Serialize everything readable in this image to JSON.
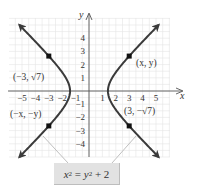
{
  "chart_data": {
    "type": "line",
    "title": "",
    "equation": "x^2 = y^2 + 2",
    "equation_display": {
      "lhs_var": "x",
      "lhs_exp": "2",
      "eq": " = ",
      "rhs_var": "y",
      "rhs_exp": "2",
      "rhs_tail": " + 2"
    },
    "xlabel": "x",
    "ylabel": "y",
    "xlim": [
      -5.5,
      6
    ],
    "ylim": [
      -5,
      5.5
    ],
    "grid": true,
    "x_ticks": [
      -5,
      -4,
      -3,
      -2,
      -1,
      1,
      2,
      3,
      4,
      5
    ],
    "y_ticks": [
      4,
      3,
      2,
      1,
      -1,
      -2,
      -3,
      -4
    ],
    "x_tick_labels": [
      "−5",
      "−4",
      "−3",
      "−2",
      "−1",
      "1",
      "2",
      "3",
      "4",
      "5"
    ],
    "y_tick_labels": [
      "4",
      "3",
      "2",
      "1",
      "−1",
      "−2",
      "−3",
      "−4"
    ],
    "series": [
      {
        "name": "right branch",
        "x_fn": "sqrt(y^2+2)",
        "y_range": [
          -5,
          5
        ],
        "vertex": [
          1.414,
          0
        ]
      },
      {
        "name": "left branch",
        "x_fn": "-sqrt(y^2+2)",
        "y_range": [
          -5,
          5
        ],
        "vertex": [
          -1.414,
          0
        ]
      }
    ],
    "points": [
      {
        "x": 3,
        "y": 2.646,
        "label": "(x, y)"
      },
      {
        "x": -3,
        "y": 2.646,
        "label": "(−3, √7)"
      },
      {
        "x": -3,
        "y": -2.646,
        "label": "(−x, −y)"
      },
      {
        "x": 3,
        "y": -2.646,
        "label": "(3, −√7)"
      }
    ],
    "annotations": [
      {
        "text": "x² = y² + 2",
        "type": "callout-box",
        "points_to": [
          "left branch",
          "right branch"
        ]
      }
    ]
  },
  "labels": {
    "x_axis": "x",
    "y_axis": "y",
    "pt_right_top": "(x, y)",
    "pt_left_top": "(−3, √7)",
    "pt_left_bottom": "(−x, −y)",
    "pt_right_bottom": "(3, −√7)"
  },
  "colors": {
    "curve": "#3a3a3a",
    "grid": "#e4e4e4",
    "axis": "#555555",
    "leader": "#b8b8b8",
    "box": "#e2e2e2"
  }
}
